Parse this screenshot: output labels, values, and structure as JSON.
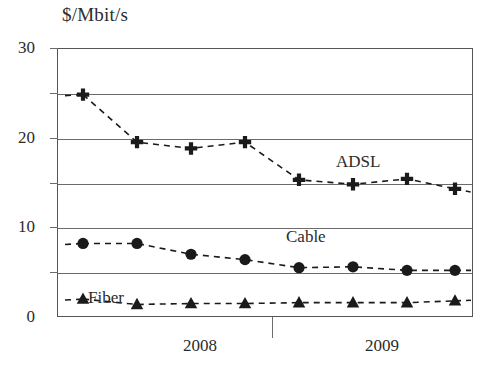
{
  "chart_data": {
    "type": "line",
    "title": "$/Mbit/s",
    "xlabel": "",
    "ylabel": "$/Mbit/s",
    "ylim": [
      0,
      30
    ],
    "yticks_labeled": [
      0,
      10,
      20,
      30
    ],
    "ygridlines": [
      5,
      10,
      15,
      20,
      25,
      30
    ],
    "grid": true,
    "legend_position": "inline-annotations",
    "xtick_labels": [
      "2008",
      "2009"
    ],
    "xtick_label_positions": [
      200,
      382
    ],
    "xtick_mark_positions": [
      272
    ],
    "x": [
      1,
      2,
      3,
      4,
      5,
      6,
      7,
      8
    ],
    "x_pixels": [
      83,
      137,
      191,
      245,
      299,
      353,
      407,
      455
    ],
    "series": [
      {
        "name": "ADSL",
        "marker": "cross",
        "label_x": 336,
        "label_y": 152,
        "values": [
          24.8,
          19.5,
          18.8,
          19.5,
          15.3,
          14.8,
          15.4,
          14.3
        ]
      },
      {
        "name": "Cable",
        "marker": "circle",
        "label_x": 286,
        "label_y": 227,
        "values": [
          8.2,
          8.2,
          7.0,
          6.4,
          5.5,
          5.6,
          5.2,
          5.2
        ]
      },
      {
        "name": "Fiber",
        "marker": "triangle",
        "label_x": 88,
        "label_y": 288,
        "values": [
          2.0,
          1.4,
          1.5,
          1.5,
          1.6,
          1.6,
          1.6,
          1.8
        ]
      }
    ]
  },
  "colors": {
    "marker": "#1a1a1a",
    "gridline": "#6b6b6b",
    "frame": "#555555",
    "text": "#2b2b2b",
    "background": "#ffffff"
  }
}
